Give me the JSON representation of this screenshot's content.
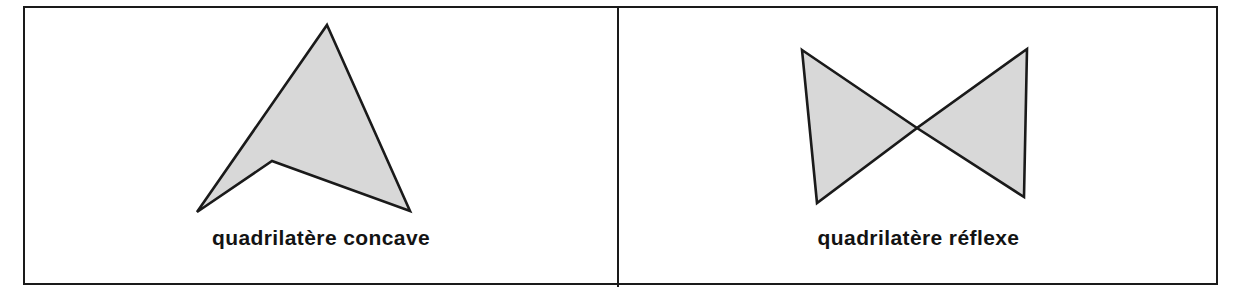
{
  "figure": {
    "background_color": "#ffffff",
    "border_color": "#1a1a1a",
    "shape_fill_color": "#d8d8d8",
    "shape_stroke_color": "#1a1a1a",
    "text_color": "#131313",
    "panels": [
      {
        "id": "panel-concave",
        "caption": "quadrilatère concave",
        "shape_name": "concave-quadrilateral",
        "shape_type": "dart",
        "vertices": [
          {
            "x": 327,
            "y": 25
          },
          {
            "x": 410,
            "y": 211
          },
          {
            "x": 272,
            "y": 161
          },
          {
            "x": 197,
            "y": 212
          }
        ]
      },
      {
        "id": "panel-reflexe",
        "caption": "quadrilatère réflexe",
        "shape_name": "crossed-quadrilateral",
        "shape_type": "bowtie",
        "vertices": [
          {
            "x": 802,
            "y": 50
          },
          {
            "x": 1027,
            "y": 49
          },
          {
            "x": 817,
            "y": 203
          },
          {
            "x": 1024,
            "y": 197
          }
        ],
        "crossing_point": {
          "x": 917,
          "y": 128
        }
      }
    ]
  }
}
